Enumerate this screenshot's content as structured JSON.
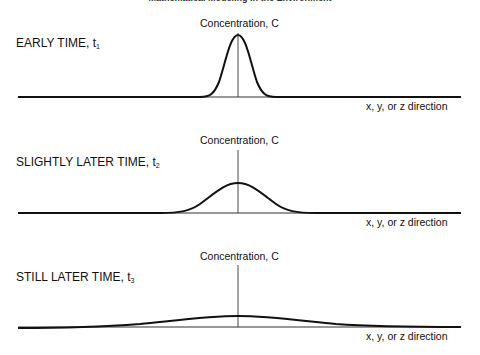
{
  "header": {
    "title": "Mathematical Modeling in the Environment"
  },
  "panels": [
    {
      "label": "EARLY TIME, t",
      "subscript": "1",
      "vertical_axis_label": "Concentration, C",
      "horizontal_axis_label": "x, y, or z direction",
      "curve": "narrow tall gaussian"
    },
    {
      "label": "SLIGHTLY LATER TIME, t",
      "subscript": "2",
      "vertical_axis_label": "Concentration, C",
      "horizontal_axis_label": "x, y, or z direction",
      "curve": "medium gaussian"
    },
    {
      "label": "STILL LATER TIME, t",
      "subscript": "3",
      "vertical_axis_label": "Concentration, C",
      "horizontal_axis_label": "x, y, or z direction",
      "curve": "wide flat gaussian"
    }
  ],
  "colors": {
    "line": "#111111",
    "axis": "#333333",
    "background": "#ffffff"
  }
}
